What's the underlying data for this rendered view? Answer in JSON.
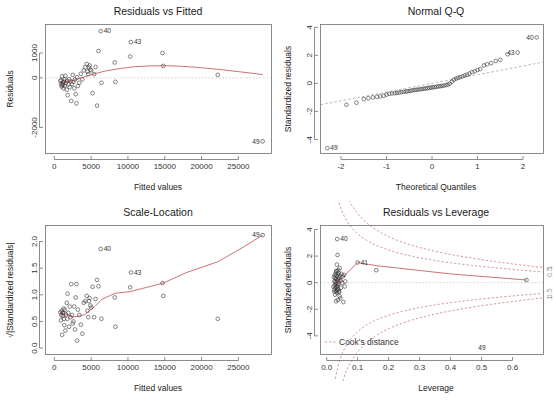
{
  "figure": {
    "kind": "r-regression-diagnostic-plots",
    "panel_count": 4,
    "background": "#ffffff",
    "point_color": "#3a3a3a",
    "smooth_color": "#b03030",
    "frame_color": "#6e6e6e"
  },
  "chart_data": [
    {
      "id": "residuals-vs-fitted",
      "type": "scatter",
      "title": "Residuals vs Fitted",
      "xlabel": "Fitted values",
      "ylabel": "Residuals",
      "xlim": [
        -1200,
        29500
      ],
      "ylim": [
        -3050,
        2150
      ],
      "xticks": [
        0,
        5000,
        10000,
        15000,
        20000,
        25000
      ],
      "xticklabels": [
        "0",
        "5000",
        "10000",
        "15000",
        "20000",
        "25000"
      ],
      "yticks": [
        -2000,
        0,
        1000
      ],
      "yticklabels": [
        "-2000",
        "0",
        "1000"
      ],
      "grid": false,
      "legend": "none",
      "x": [
        820,
        900,
        950,
        1000,
        1050,
        1100,
        1150,
        1200,
        1250,
        1300,
        1350,
        1400,
        1500,
        1600,
        1700,
        1750,
        1800,
        1900,
        2000,
        2100,
        2200,
        2300,
        2400,
        2500,
        2600,
        2700,
        2800,
        2900,
        3000,
        3100,
        3200,
        3400,
        3600,
        3800,
        4000,
        4200,
        4400,
        4500,
        4600,
        4700,
        4800,
        4900,
        5000,
        5200,
        5400,
        5600,
        5800,
        6000,
        6300,
        6400,
        8200,
        8300,
        10300,
        10400,
        14700,
        14800,
        22200,
        28300
      ],
      "y": [
        -120,
        -260,
        -90,
        -350,
        60,
        -300,
        -240,
        -180,
        -420,
        -150,
        -60,
        -330,
        80,
        -200,
        -480,
        -120,
        -700,
        -260,
        -60,
        -380,
        -140,
        -930,
        -250,
        120,
        -160,
        -420,
        -70,
        -660,
        -1030,
        20,
        -330,
        -200,
        160,
        -60,
        300,
        420,
        560,
        250,
        150,
        420,
        500,
        330,
        300,
        -620,
        150,
        440,
        -1120,
        1080,
        1880,
        -200,
        620,
        -160,
        860,
        1440,
        1000,
        480,
        120,
        -2560
      ],
      "smooth_x": [
        820,
        3000,
        5000,
        7000,
        9000,
        11000,
        13000,
        15000,
        17000,
        19000,
        21000,
        23000,
        25000,
        27000,
        28300
      ],
      "smooth_y": [
        -230,
        -70,
        130,
        280,
        380,
        450,
        480,
        490,
        470,
        430,
        380,
        320,
        250,
        180,
        130
      ],
      "annotations": [
        {
          "label": "40",
          "x": 6300,
          "y": 1880
        },
        {
          "label": "43",
          "x": 10400,
          "y": 1440
        },
        {
          "label": "49",
          "x": 28300,
          "y": -2560
        }
      ]
    },
    {
      "id": "normal-qq",
      "type": "scatter",
      "title": "Normal Q-Q",
      "xlabel": "Theoretical Quantiles",
      "ylabel": "Standardized residuals",
      "xlim": [
        -2.45,
        2.45
      ],
      "ylim": [
        -5.0,
        4.2
      ],
      "xticks": [
        -2,
        -1,
        0,
        1,
        2
      ],
      "xticklabels": [
        "-2",
        "-1",
        "0",
        "1",
        "2"
      ],
      "yticks": [
        -4,
        -2,
        0,
        2,
        4
      ],
      "yticklabels": [
        "-4",
        "-2",
        "0",
        "2",
        "4"
      ],
      "grid": false,
      "legend": "none",
      "reference_line": {
        "slope": 0.62,
        "intercept": 0.0,
        "style": "dashed"
      },
      "x": [
        -2.3,
        -1.88,
        -1.66,
        -1.5,
        -1.4,
        -1.3,
        -1.21,
        -1.14,
        -1.06,
        -1.0,
        -0.94,
        -0.88,
        -0.82,
        -0.77,
        -0.72,
        -0.67,
        -0.62,
        -0.57,
        -0.53,
        -0.48,
        -0.44,
        -0.39,
        -0.35,
        -0.31,
        -0.26,
        -0.22,
        -0.18,
        -0.14,
        -0.1,
        -0.06,
        -0.02,
        0.02,
        0.06,
        0.1,
        0.14,
        0.18,
        0.22,
        0.26,
        0.31,
        0.35,
        0.39,
        0.44,
        0.48,
        0.53,
        0.57,
        0.62,
        0.67,
        0.72,
        0.77,
        0.82,
        0.88,
        0.94,
        1.0,
        1.06,
        1.14,
        1.21,
        1.3,
        1.4,
        1.5,
        1.66,
        1.88,
        2.3
      ],
      "y": [
        -4.62,
        -1.52,
        -1.38,
        -1.12,
        -1.06,
        -1.0,
        -0.96,
        -0.92,
        -0.88,
        -0.8,
        -0.74,
        -0.72,
        -0.7,
        -0.68,
        -0.65,
        -0.62,
        -0.6,
        -0.58,
        -0.56,
        -0.54,
        -0.5,
        -0.48,
        -0.46,
        -0.44,
        -0.42,
        -0.4,
        -0.38,
        -0.36,
        -0.34,
        -0.32,
        -0.3,
        -0.28,
        -0.26,
        -0.24,
        -0.22,
        -0.2,
        -0.18,
        -0.16,
        -0.12,
        -0.08,
        -0.02,
        0.12,
        0.26,
        0.34,
        0.4,
        0.44,
        0.5,
        0.56,
        0.62,
        0.7,
        0.8,
        0.86,
        0.96,
        1.02,
        1.28,
        1.36,
        1.44,
        1.6,
        1.68,
        2.08,
        2.2,
        3.28
      ],
      "annotations": [
        {
          "label": "40",
          "x": 2.3,
          "y": 3.28
        },
        {
          "label": "43",
          "x": 1.88,
          "y": 2.2
        },
        {
          "label": "49",
          "x": -2.3,
          "y": -4.62
        }
      ]
    },
    {
      "id": "scale-location",
      "type": "scatter",
      "title": "Scale-Location",
      "xlabel": "Fitted values",
      "ylabel": "√|Standardized residuals|",
      "xlim": [
        -1200,
        29500
      ],
      "ylim": [
        -0.12,
        2.3
      ],
      "xticks": [
        0,
        5000,
        10000,
        15000,
        20000,
        25000
      ],
      "xticklabels": [
        "0",
        "5000",
        "10000",
        "15000",
        "20000",
        "25000"
      ],
      "yticks": [
        0.0,
        0.5,
        1.0,
        1.5,
        2.0
      ],
      "yticklabels": [
        "0.0",
        "0.5",
        "1.0",
        "1.5",
        "2.0"
      ],
      "grid": false,
      "legend": "none",
      "x": [
        820,
        900,
        950,
        1000,
        1050,
        1100,
        1150,
        1200,
        1250,
        1300,
        1350,
        1400,
        1500,
        1600,
        1700,
        1750,
        1800,
        1900,
        2000,
        2100,
        2200,
        2300,
        2400,
        2500,
        2600,
        2700,
        2800,
        2900,
        3000,
        3100,
        3200,
        3400,
        3600,
        3800,
        4000,
        4200,
        4400,
        4500,
        4600,
        4700,
        4800,
        4900,
        5000,
        5200,
        5400,
        5600,
        5800,
        6000,
        6300,
        6400,
        8200,
        8300,
        10300,
        10400,
        14700,
        14800,
        22200,
        28300
      ],
      "y": [
        0.67,
        0.52,
        0.62,
        0.7,
        0.25,
        0.66,
        0.6,
        0.66,
        0.74,
        0.55,
        0.43,
        0.72,
        0.33,
        0.63,
        0.85,
        0.55,
        1.02,
        0.66,
        0.4,
        0.78,
        0.58,
        1.2,
        0.62,
        0.46,
        0.5,
        0.78,
        0.35,
        0.95,
        1.2,
        0.14,
        0.72,
        0.62,
        0.44,
        0.27,
        0.85,
        0.88,
        0.98,
        0.7,
        0.58,
        0.88,
        0.94,
        0.8,
        0.76,
        1.15,
        0.58,
        0.92,
        1.28,
        1.16,
        1.86,
        0.55,
        0.95,
        0.4,
        1.14,
        1.42,
        1.22,
        0.98,
        0.55,
        2.12
      ],
      "smooth_x": [
        820,
        2500,
        4000,
        5500,
        6500,
        8300,
        10300,
        12000,
        14800,
        18000,
        22200,
        25500,
        28300
      ],
      "smooth_y": [
        0.66,
        0.58,
        0.62,
        0.78,
        0.92,
        1.03,
        1.06,
        1.12,
        1.22,
        1.42,
        1.62,
        1.88,
        2.12
      ],
      "annotations": [
        {
          "label": "40",
          "x": 6300,
          "y": 1.86
        },
        {
          "label": "43",
          "x": 10400,
          "y": 1.42
        },
        {
          "label": "49",
          "x": 28300,
          "y": 2.12
        }
      ]
    },
    {
      "id": "residuals-vs-leverage",
      "type": "scatter",
      "title": "Residuals vs Leverage",
      "xlabel": "Leverage",
      "ylabel": "Standardized residuals",
      "xlim": [
        -0.02,
        0.7
      ],
      "ylim": [
        -5.4,
        4.3
      ],
      "xticks": [
        0.0,
        0.1,
        0.2,
        0.3,
        0.4,
        0.5,
        0.6
      ],
      "xticklabels": [
        "0.0",
        "0.1",
        "0.2",
        "0.3",
        "0.4",
        "0.5",
        "0.6"
      ],
      "yticks": [
        -4,
        -2,
        0,
        2,
        4
      ],
      "yticklabels": [
        "-4",
        "-2",
        "0",
        "2",
        "4"
      ],
      "grid": false,
      "legend": "Cook's distance",
      "cook_levels": [
        0.5,
        1.0
      ],
      "cook_level_labels": [
        "1",
        "0.5"
      ],
      "x": [
        0.022,
        0.023,
        0.024,
        0.025,
        0.025,
        0.026,
        0.026,
        0.027,
        0.027,
        0.028,
        0.028,
        0.029,
        0.029,
        0.03,
        0.03,
        0.031,
        0.031,
        0.032,
        0.032,
        0.033,
        0.033,
        0.034,
        0.034,
        0.035,
        0.035,
        0.036,
        0.036,
        0.037,
        0.037,
        0.038,
        0.038,
        0.039,
        0.04,
        0.041,
        0.042,
        0.043,
        0.044,
        0.045,
        0.046,
        0.048,
        0.05,
        0.052,
        0.054,
        0.056,
        0.058,
        0.06,
        0.034,
        0.036,
        0.038,
        0.04,
        0.042,
        0.03,
        0.032,
        0.035,
        0.1,
        0.16,
        0.645
      ],
      "y": [
        -0.3,
        0.42,
        -0.52,
        0.1,
        -0.68,
        0.58,
        -0.2,
        0.34,
        -0.9,
        0.06,
        -0.4,
        0.7,
        -0.12,
        0.26,
        -0.62,
        0.88,
        -0.04,
        0.5,
        -0.34,
        1.36,
        -0.76,
        0.18,
        -0.26,
        2.08,
        -0.58,
        0.62,
        -0.14,
        0.3,
        -0.46,
        0.74,
        -0.08,
        0.4,
        -0.7,
        0.22,
        -1.02,
        0.54,
        -1.18,
        0.14,
        -0.38,
        0.66,
        -0.02,
        0.46,
        -1.46,
        0.58,
        -0.28,
        0.1,
        3.28,
        -1.3,
        0.94,
        -0.66,
        1.1,
        -1.4,
        0.86,
        -0.5,
        1.52,
        0.94,
        0.2
      ],
      "smooth_x": [
        0.022,
        0.035,
        0.05,
        0.1,
        0.16,
        0.4,
        0.645
      ],
      "smooth_y": [
        -0.12,
        0.02,
        0.36,
        1.52,
        1.28,
        0.66,
        0.2
      ],
      "annotations": [
        {
          "label": "40",
          "x": 0.034,
          "y": 3.28
        },
        {
          "label": "41",
          "x": 0.1,
          "y": 1.52
        },
        {
          "label": "49",
          "x": 0.48,
          "y": -4.9
        }
      ]
    }
  ]
}
